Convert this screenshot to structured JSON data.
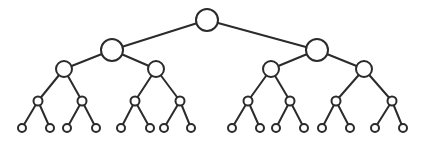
{
  "diagram": {
    "type": "binary-tree",
    "depth": 5,
    "colors": {
      "stroke": "#2b2b2b",
      "fill": "#ffffff",
      "background": "#ffffff"
    },
    "nodes": [
      {
        "id": 0,
        "level": 0,
        "x": 207,
        "y": 20,
        "r": 11
      },
      {
        "id": 1,
        "level": 1,
        "x": 112,
        "y": 50,
        "r": 11
      },
      {
        "id": 2,
        "level": 1,
        "x": 317,
        "y": 50,
        "r": 11
      },
      {
        "id": 3,
        "level": 2,
        "x": 64,
        "y": 69,
        "r": 8
      },
      {
        "id": 4,
        "level": 2,
        "x": 156,
        "y": 69,
        "r": 8
      },
      {
        "id": 5,
        "level": 2,
        "x": 271,
        "y": 69,
        "r": 8
      },
      {
        "id": 6,
        "level": 2,
        "x": 364,
        "y": 69,
        "r": 8
      },
      {
        "id": 7,
        "level": 3,
        "x": 38,
        "y": 101,
        "r": 4.5
      },
      {
        "id": 8,
        "level": 3,
        "x": 82,
        "y": 101,
        "r": 4.5
      },
      {
        "id": 9,
        "level": 3,
        "x": 135,
        "y": 101,
        "r": 4.5
      },
      {
        "id": 10,
        "level": 3,
        "x": 180,
        "y": 101,
        "r": 4.5
      },
      {
        "id": 11,
        "level": 3,
        "x": 248,
        "y": 101,
        "r": 4.5
      },
      {
        "id": 12,
        "level": 3,
        "x": 290,
        "y": 101,
        "r": 4.5
      },
      {
        "id": 13,
        "level": 3,
        "x": 336,
        "y": 101,
        "r": 4.5
      },
      {
        "id": 14,
        "level": 3,
        "x": 392,
        "y": 101,
        "r": 4.5
      },
      {
        "id": 15,
        "level": 4,
        "x": 22,
        "y": 128,
        "r": 4
      },
      {
        "id": 16,
        "level": 4,
        "x": 50,
        "y": 128,
        "r": 4
      },
      {
        "id": 17,
        "level": 4,
        "x": 67,
        "y": 128,
        "r": 4
      },
      {
        "id": 18,
        "level": 4,
        "x": 96,
        "y": 128,
        "r": 4
      },
      {
        "id": 19,
        "level": 4,
        "x": 121,
        "y": 128,
        "r": 4
      },
      {
        "id": 20,
        "level": 4,
        "x": 150,
        "y": 128,
        "r": 4
      },
      {
        "id": 21,
        "level": 4,
        "x": 164,
        "y": 128,
        "r": 4
      },
      {
        "id": 22,
        "level": 4,
        "x": 191,
        "y": 128,
        "r": 4
      },
      {
        "id": 23,
        "level": 4,
        "x": 232,
        "y": 128,
        "r": 4
      },
      {
        "id": 24,
        "level": 4,
        "x": 260,
        "y": 128,
        "r": 4
      },
      {
        "id": 25,
        "level": 4,
        "x": 276,
        "y": 128,
        "r": 4
      },
      {
        "id": 26,
        "level": 4,
        "x": 304,
        "y": 128,
        "r": 4
      },
      {
        "id": 27,
        "level": 4,
        "x": 322,
        "y": 128,
        "r": 4
      },
      {
        "id": 28,
        "level": 4,
        "x": 350,
        "y": 128,
        "r": 4
      },
      {
        "id": 29,
        "level": 4,
        "x": 375,
        "y": 128,
        "r": 4
      },
      {
        "id": 30,
        "level": 4,
        "x": 403,
        "y": 128,
        "r": 4
      }
    ],
    "edges": [
      [
        0,
        1
      ],
      [
        0,
        2
      ],
      [
        1,
        3
      ],
      [
        1,
        4
      ],
      [
        2,
        5
      ],
      [
        2,
        6
      ],
      [
        3,
        7
      ],
      [
        3,
        8
      ],
      [
        4,
        9
      ],
      [
        4,
        10
      ],
      [
        5,
        11
      ],
      [
        5,
        12
      ],
      [
        6,
        13
      ],
      [
        6,
        14
      ],
      [
        7,
        15
      ],
      [
        7,
        16
      ],
      [
        8,
        17
      ],
      [
        8,
        18
      ],
      [
        9,
        19
      ],
      [
        9,
        20
      ],
      [
        10,
        21
      ],
      [
        10,
        22
      ],
      [
        11,
        23
      ],
      [
        11,
        24
      ],
      [
        12,
        25
      ],
      [
        12,
        26
      ],
      [
        13,
        27
      ],
      [
        13,
        28
      ],
      [
        14,
        29
      ],
      [
        14,
        30
      ]
    ]
  }
}
